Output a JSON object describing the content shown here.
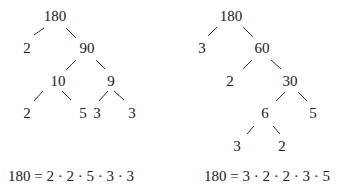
{
  "trees": [
    {
      "name": "left-factor-tree",
      "nodes": [
        {
          "id": "L0",
          "label": "180",
          "x": 55,
          "y": 16
        },
        {
          "id": "L1",
          "label": "2",
          "x": 27,
          "y": 48
        },
        {
          "id": "L2",
          "label": "90",
          "x": 87,
          "y": 48
        },
        {
          "id": "L3",
          "label": "10",
          "x": 58,
          "y": 81
        },
        {
          "id": "L4",
          "label": "9",
          "x": 111,
          "y": 81
        },
        {
          "id": "L5",
          "label": "2",
          "x": 27,
          "y": 113
        },
        {
          "id": "L6",
          "label": "5",
          "x": 83,
          "y": 113
        },
        {
          "id": "L7",
          "label": "3",
          "x": 97,
          "y": 113
        },
        {
          "id": "L8",
          "label": "3",
          "x": 132,
          "y": 113
        }
      ],
      "edges": [
        [
          34,
          35,
          44,
          28
        ],
        [
          66,
          28,
          76,
          38
        ],
        [
          66,
          70,
          76,
          60
        ],
        [
          96,
          60,
          105,
          69
        ],
        [
          34,
          101,
          43,
          91
        ],
        [
          62,
          91,
          71,
          100
        ],
        [
          99,
          101,
          108,
          91
        ],
        [
          114,
          91,
          124,
          100
        ]
      ],
      "equation": "180 = 2 · 2 · 5 · 3 · 3",
      "equation_x": 8,
      "equation_y": 169
    },
    {
      "name": "right-factor-tree",
      "nodes": [
        {
          "id": "R0",
          "label": "180",
          "x": 231,
          "y": 16
        },
        {
          "id": "R1",
          "label": "3",
          "x": 202,
          "y": 48
        },
        {
          "id": "R2",
          "label": "60",
          "x": 262,
          "y": 48
        },
        {
          "id": "R3",
          "label": "2",
          "x": 230,
          "y": 81
        },
        {
          "id": "R4",
          "label": "30",
          "x": 290,
          "y": 81
        },
        {
          "id": "R5",
          "label": "6",
          "x": 265,
          "y": 113
        },
        {
          "id": "R6",
          "label": "5",
          "x": 313,
          "y": 113
        },
        {
          "id": "R7",
          "label": "3",
          "x": 237,
          "y": 146
        },
        {
          "id": "R8",
          "label": "2",
          "x": 282,
          "y": 146
        }
      ],
      "edges": [
        [
          208,
          36,
          217,
          27
        ],
        [
          243,
          27,
          253,
          37
        ],
        [
          243,
          69,
          252,
          60
        ],
        [
          271,
          60,
          281,
          69
        ],
        [
          276,
          101,
          285,
          92
        ],
        [
          298,
          92,
          307,
          101
        ],
        [
          247,
          134,
          254,
          126
        ],
        [
          273,
          126,
          280,
          134
        ]
      ],
      "equation": "180 = 3 · 2 · 2 · 3 · 5",
      "equation_x": 204,
      "equation_y": 169
    }
  ]
}
